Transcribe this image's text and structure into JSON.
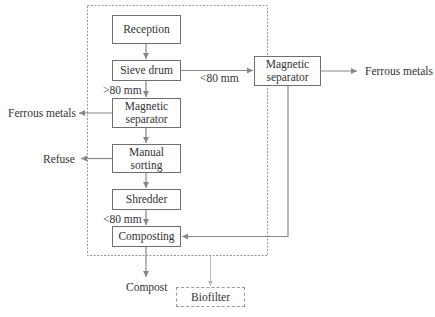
{
  "diagram": {
    "type": "process-flowchart",
    "nodes": {
      "reception": "Reception",
      "sieve_drum": "Sieve drum",
      "magnetic_separator_left": [
        "Magnetic",
        "separator"
      ],
      "manual_sorting": [
        "Manual",
        "sorting"
      ],
      "shredder": "Shredder",
      "composting": "Composting",
      "magnetic_separator_right": [
        "Magnetic",
        "separator"
      ],
      "biofilter": "Biofilter"
    },
    "labels": {
      "gt80": ">80 mm",
      "lt80_right": "<80 mm",
      "lt80_bottom": "<80 mm",
      "ferrous_left": "Ferrous metals",
      "ferrous_right": "Ferrous metals",
      "refuse": "Refuse",
      "compost": "Compost"
    },
    "edges": [
      {
        "from": "Reception",
        "to": "Sieve drum"
      },
      {
        "from": "Sieve drum",
        "to": "Magnetic separator (left)",
        "label": ">80 mm"
      },
      {
        "from": "Sieve drum",
        "to": "Magnetic separator (right)",
        "label": "<80 mm"
      },
      {
        "from": "Magnetic separator (left)",
        "to": "Ferrous metals"
      },
      {
        "from": "Magnetic separator (left)",
        "to": "Manual sorting"
      },
      {
        "from": "Manual sorting",
        "to": "Refuse"
      },
      {
        "from": "Manual sorting",
        "to": "Shredder"
      },
      {
        "from": "Shredder",
        "to": "Composting",
        "label": "<80 mm"
      },
      {
        "from": "Magnetic separator (right)",
        "to": "Ferrous metals"
      },
      {
        "from": "Magnetic separator (right)",
        "to": "Composting"
      },
      {
        "from": "Composting",
        "to": "Compost"
      },
      {
        "from": "Facility enclosure",
        "to": "Biofilter",
        "style": "dashed"
      }
    ]
  }
}
